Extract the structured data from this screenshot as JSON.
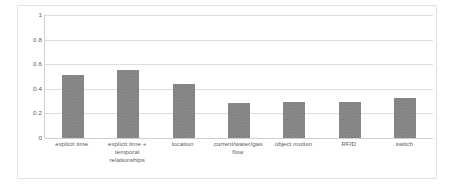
{
  "chart_data": {
    "type": "bar",
    "title": "",
    "subtitle": "",
    "xlabel": "",
    "ylabel": "",
    "ylim": [
      0,
      1
    ],
    "yticks": [
      "0",
      "0.2",
      "0.4",
      "0.6",
      "0.8",
      "1"
    ],
    "ytick_values": [
      0,
      0.2,
      0.4,
      0.6,
      0.8,
      1
    ],
    "grid": true,
    "legend": false,
    "legend_position": "none",
    "categories": [
      "explicit time",
      "explicit time + temporal relationships",
      "location",
      "current/water/gas flow",
      "object motion",
      "RFID",
      "switch"
    ],
    "values": [
      0.51,
      0.55,
      0.44,
      0.285,
      0.29,
      0.295,
      0.325
    ],
    "bar_color": "#808080",
    "gridline_color": "#dedede",
    "axis_text_color": "#5a5a5a",
    "plot_background": "#ffffff",
    "border_color": "#e2e2e2"
  }
}
